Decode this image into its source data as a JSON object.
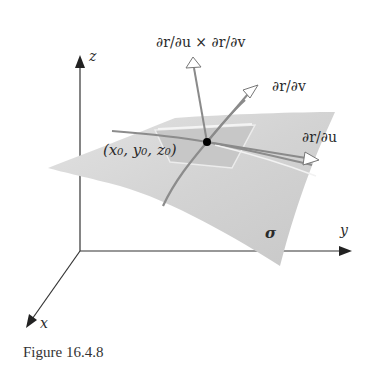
{
  "figure": {
    "caption": "Figure 16.4.8",
    "axes": {
      "z_label": "z",
      "y_label": "y",
      "x_label": "x"
    },
    "surface": {
      "name_label": "σ",
      "point_label": "(x₀, y₀, z₀)"
    },
    "vectors": {
      "normal_label": "∂r/∂u × ∂r/∂v",
      "r_v_label": "∂r/∂v",
      "r_u_label": "∂r/∂u"
    },
    "colors": {
      "surface_fill": "#d6d6d6",
      "patch_fill": "#c4c4c4",
      "curve_color": "#8a8a8a",
      "axis_color": "#333333",
      "point_color": "#000000"
    }
  }
}
